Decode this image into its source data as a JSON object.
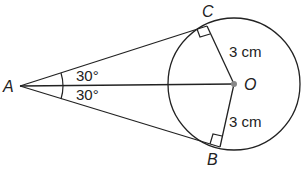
{
  "diagram": {
    "points": {
      "A": {
        "label": "A",
        "x": 20,
        "y": 86
      },
      "O": {
        "label": "O",
        "x": 234,
        "y": 84
      },
      "C": {
        "label": "C",
        "x": 207,
        "y": 26
      },
      "B": {
        "label": "B",
        "x": 220,
        "y": 147
      }
    },
    "circle": {
      "center": "O",
      "radius": 66
    },
    "angles": {
      "upper": "30°",
      "lower": "30°"
    },
    "lengths": {
      "OC": "3 cm",
      "OB": "3 cm"
    },
    "colors": {
      "stroke": "#222222",
      "center_dot": "#888888"
    }
  }
}
